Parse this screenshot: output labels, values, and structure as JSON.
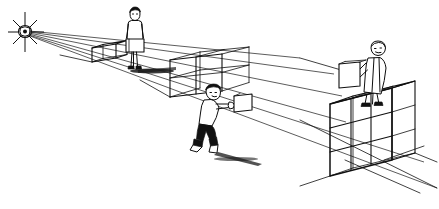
{
  "illustration": {
    "title": "One-point perspective drawing with figures and cube grid",
    "medium": "black ink line drawing on white",
    "background_color": "#ffffff",
    "line_color": "#101010",
    "canvas": {
      "width": 439,
      "height": 209
    }
  },
  "vanishing_point": {
    "label": "vanishing point",
    "x": 25,
    "y": 32,
    "marker": "starburst-cross",
    "ray_count": 6
  },
  "perspective_rays": [
    {
      "name": "ray-top-wall",
      "x2": 300,
      "y2": 58
    },
    {
      "name": "ray-upper-edge",
      "x2": 330,
      "y2": 72
    },
    {
      "name": "ray-mid-edge",
      "x2": 340,
      "y2": 96
    },
    {
      "name": "ray-lower-edge",
      "x2": 345,
      "y2": 120
    },
    {
      "name": "ray-ground-front",
      "x2": 420,
      "y2": 160
    },
    {
      "name": "ray-ground-far",
      "x2": 435,
      "y2": 185
    }
  ],
  "figures": [
    {
      "name": "figure-standing-midground",
      "description": "standing person holding a briefcase, facing viewer",
      "pose": "standing",
      "carries": "briefcase",
      "has_shadow": true,
      "position": {
        "x": 134,
        "y": 40
      }
    },
    {
      "name": "figure-crouching-foreground",
      "description": "bent-over person pushing a box along the ground",
      "pose": "crouching",
      "carries": "box",
      "has_shadow": true,
      "position": {
        "x": 212,
        "y": 115
      }
    },
    {
      "name": "figure-carrying-right",
      "description": "person carrying a box while standing on top of the cube stack",
      "pose": "walking",
      "carries": "box",
      "has_shadow": false,
      "position": {
        "x": 378,
        "y": 70
      }
    }
  ],
  "cube_structures": [
    {
      "name": "cube-small-far",
      "description": "small single cube far down the receding row",
      "columns": 1,
      "rows": 1,
      "position": {
        "x": 92,
        "y": 48
      }
    },
    {
      "name": "cube-block-middle",
      "description": "wireframe grid block of stacked cubes in the middle distance",
      "columns": 2,
      "rows": 2,
      "position": {
        "x": 170,
        "y": 60
      }
    },
    {
      "name": "cube-block-right",
      "description": "large wireframe grid block of stacked cubes nearest the viewer",
      "columns": 3,
      "rows": 3,
      "position": {
        "x": 330,
        "y": 90
      }
    }
  ],
  "ground": {
    "name": "ground-plane",
    "description": "receding ground plane defined by converging perspective lines"
  }
}
